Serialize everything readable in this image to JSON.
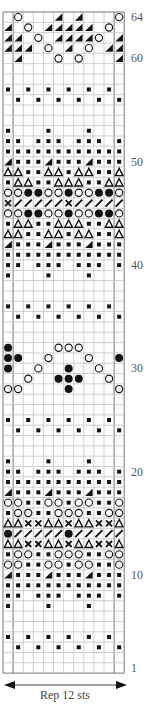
{
  "chart_data": {
    "type": "knitting-chart",
    "title": "",
    "columns": 12,
    "rows": 64,
    "row_labels": [
      "64",
      "60",
      "50",
      "40",
      "30",
      "20",
      "10",
      "1"
    ],
    "repeat_caption": "Rep 12 sts",
    "symbol_key": {
      ".": "empty",
      "s": "small-filled-square",
      "o": "open-circle",
      "b": "filled-circle",
      "t": "open-triangle",
      "w": "filled-wedge-triangle",
      "x": "cross",
      "/": "diagonal-slash"
    },
    "grid_rows_top_to_bottom": [
      {
        "row": 64,
        "cells": ".o...w.w...o"
      },
      {
        "row": 63,
        "cells": "w.o.wwwww.o."
      },
      {
        "row": 62,
        "cells": "ww.o.wwwwo.w"
      },
      {
        "row": 61,
        "cells": "www.o.w.o.ww"
      },
      {
        "row": 60,
        "cells": ".w...o.o...w"
      },
      {
        "row": 59,
        "cells": "............"
      },
      {
        "row": 58,
        "cells": "............"
      },
      {
        "row": 57,
        "cells": "s.s.s.s.s.s."
      },
      {
        "row": 56,
        "cells": ".s.s.s.s.s.s"
      },
      {
        "row": 55,
        "cells": "............"
      },
      {
        "row": 54,
        "cells": "............"
      },
      {
        "row": 53,
        "cells": "s...s...s..."
      },
      {
        "row": 52,
        "cells": "ss.sss.sss.s"
      },
      {
        "row": 51,
        "cells": "ssssssssssss"
      },
      {
        "row": 50,
        "cells": "wssswssswsss"
      },
      {
        "row": 49,
        "cells": "ttssttsttsst"
      },
      {
        "row": 48,
        "cells": "sttsstttsstt"
      },
      {
        "row": 47,
        "cells": "oobbooboobbo"
      },
      {
        "row": 46,
        "cells": "x/////x/////"
      },
      {
        "row": 45,
        "cells": "oobbooboobbo"
      },
      {
        "row": 44,
        "cells": "sttsstttsstt"
      },
      {
        "row": 43,
        "cells": "ttssttsttsst"
      },
      {
        "row": 42,
        "cells": "wssswssswsss"
      },
      {
        "row": 41,
        "cells": "ssssssssssss"
      },
      {
        "row": 40,
        "cells": "ss.sss.sss.s"
      },
      {
        "row": 39,
        "cells": "s...s...s..."
      },
      {
        "row": 38,
        "cells": "............"
      },
      {
        "row": 37,
        "cells": "............"
      },
      {
        "row": 36,
        "cells": "s.s.s.s.s.s."
      },
      {
        "row": 35,
        "cells": ".s.s.s.s.s.s"
      },
      {
        "row": 34,
        "cells": "............"
      },
      {
        "row": 33,
        "cells": "............"
      },
      {
        "row": 32,
        "cells": "b....ooo...."
      },
      {
        "row": 31,
        "cells": "bb..o...o..b"
      },
      {
        "row": 30,
        "cells": "b..o..b..o.."
      },
      {
        "row": 29,
        "cells": "..o..bbb..o."
      },
      {
        "row": 28,
        "cells": "oo....b....o"
      },
      {
        "row": 27,
        "cells": "............"
      },
      {
        "row": 26,
        "cells": "............"
      },
      {
        "row": 25,
        "cells": "s.s.s.s.s.s."
      },
      {
        "row": 24,
        "cells": ".s.s.s.s.s.s"
      },
      {
        "row": 23,
        "cells": "............"
      },
      {
        "row": 22,
        "cells": "............"
      },
      {
        "row": 21,
        "cells": "s...s...s..."
      },
      {
        "row": 20,
        "cells": "ss.sss.sss.s"
      },
      {
        "row": 19,
        "cells": "ssssssssssss"
      },
      {
        "row": 18,
        "cells": "wssswssswsss"
      },
      {
        "row": 17,
        "cells": "oossoosoosso"
      },
      {
        "row": 16,
        "cells": "soossooossoo"
      },
      {
        "row": 15,
        "cells": "ttxxttxttxxt"
      },
      {
        "row": 14,
        "cells": "b/////b/////"
      },
      {
        "row": 13,
        "cells": "ttxxttxttxxt"
      },
      {
        "row": 12,
        "cells": "soossooossoo"
      },
      {
        "row": 11,
        "cells": "oossoosoosso"
      },
      {
        "row": 10,
        "cells": "wssswssswsss"
      },
      {
        "row": 9,
        "cells": "ssssssssssss"
      },
      {
        "row": 8,
        "cells": "ss.sss.sss.s"
      },
      {
        "row": 7,
        "cells": "s...s...s..."
      },
      {
        "row": 6,
        "cells": "............"
      },
      {
        "row": 5,
        "cells": "............"
      },
      {
        "row": 4,
        "cells": "s.s.s.s.s.s."
      },
      {
        "row": 3,
        "cells": ".s.s.s.s.s.s"
      },
      {
        "row": 2,
        "cells": "............"
      },
      {
        "row": 1,
        "cells": "............"
      }
    ]
  }
}
